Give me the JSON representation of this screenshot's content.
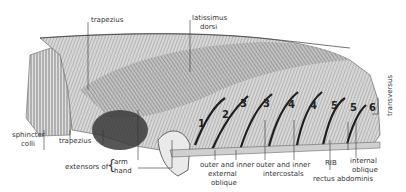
{
  "figure": {
    "labels": {
      "trapezius_top": "trapezius",
      "latissimus_1": "latissimus",
      "latissimus_2": "dorsi",
      "transversus": "transversus",
      "sphincter_1": "sphincter",
      "sphincter_2": "colli",
      "trapezius_bottom": "trapezius",
      "extensors_of": "extensors of",
      "arm": "arm",
      "hand": "hand",
      "ext_oblique_1": "outer and inner",
      "ext_oblique_2": "external",
      "ext_oblique_3": "oblique",
      "intercostals_1": "outer and inner",
      "intercostals_2": "intercostals",
      "rib": "RIB",
      "rectus": "rectus abdominis",
      "int_oblique_1": "internal",
      "int_oblique_2": "oblique"
    },
    "rib_numbers": [
      "1",
      "2",
      "3",
      "3",
      "4",
      "4",
      "5",
      "5",
      "6"
    ],
    "colors": {
      "ink": "#333333",
      "muscle_dark": "#555555",
      "muscle_light": "#cfcfcf",
      "background": "#ffffff"
    }
  }
}
